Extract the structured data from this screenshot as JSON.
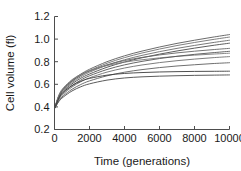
{
  "chart_data": {
    "type": "line",
    "title": "",
    "xlabel": "Time (generations)",
    "ylabel": "Cell volume (fl)",
    "xlim": [
      0,
      10000
    ],
    "ylim": [
      0.2,
      1.2
    ],
    "xticks": [
      0,
      2000,
      4000,
      6000,
      8000,
      10000
    ],
    "yticks": [
      0.2,
      0.4,
      0.6,
      0.8,
      1.0,
      1.2
    ],
    "xtick_labels": [
      "0",
      "2000",
      "4000",
      "6000",
      "8000",
      "10000"
    ],
    "ytick_labels": [
      "0.2",
      "0.4",
      "0.6",
      "0.8",
      "1.0",
      "1.2"
    ],
    "grid": false,
    "legend": false,
    "legend_position": "none",
    "x": [
      0,
      250,
      500,
      1000,
      1500,
      2000,
      3000,
      4000,
      5000,
      6000,
      7000,
      8000,
      9000,
      10000
    ],
    "series": [
      {
        "name": "line-1",
        "color": "#5a5a5a",
        "values": [
          0.385,
          0.5,
          0.56,
          0.635,
          0.69,
          0.733,
          0.8,
          0.852,
          0.894,
          0.93,
          0.962,
          0.99,
          1.016,
          1.04
        ]
      },
      {
        "name": "line-2",
        "color": "#707070",
        "values": [
          0.385,
          0.495,
          0.553,
          0.626,
          0.679,
          0.721,
          0.786,
          0.836,
          0.877,
          0.912,
          0.943,
          0.97,
          0.995,
          1.018
        ]
      },
      {
        "name": "line-3",
        "color": "#6a6a6a",
        "values": [
          0.385,
          0.49,
          0.546,
          0.616,
          0.667,
          0.707,
          0.769,
          0.817,
          0.856,
          0.889,
          0.918,
          0.944,
          0.968,
          0.99
        ]
      },
      {
        "name": "line-4",
        "color": "#4a4a4a",
        "values": [
          0.385,
          0.484,
          0.537,
          0.604,
          0.653,
          0.691,
          0.751,
          0.797,
          0.835,
          0.867,
          0.895,
          0.92,
          0.943,
          0.964
        ]
      },
      {
        "name": "line-5",
        "color": "#646464",
        "values": [
          0.385,
          0.496,
          0.556,
          0.629,
          0.679,
          0.717,
          0.772,
          0.81,
          0.838,
          0.86,
          0.878,
          0.893,
          0.906,
          0.918
        ]
      },
      {
        "name": "line-6",
        "color": "#7a7a7a",
        "values": [
          0.385,
          0.505,
          0.568,
          0.641,
          0.688,
          0.721,
          0.766,
          0.796,
          0.817,
          0.834,
          0.847,
          0.858,
          0.867,
          0.875
        ]
      },
      {
        "name": "line-7",
        "color": "#555555",
        "values": [
          0.385,
          0.472,
          0.522,
          0.588,
          0.637,
          0.675,
          0.731,
          0.772,
          0.803,
          0.828,
          0.848,
          0.865,
          0.879,
          0.892
        ]
      },
      {
        "name": "line-8",
        "color": "#6e6e6e",
        "values": [
          0.385,
          0.466,
          0.513,
          0.576,
          0.622,
          0.657,
          0.708,
          0.744,
          0.771,
          0.792,
          0.809,
          0.823,
          0.835,
          0.845
        ]
      },
      {
        "name": "line-9",
        "color": "#5f5f5f",
        "values": [
          0.385,
          0.455,
          0.498,
          0.556,
          0.598,
          0.63,
          0.675,
          0.707,
          0.73,
          0.748,
          0.762,
          0.773,
          0.783,
          0.791
        ]
      },
      {
        "name": "line-10",
        "color": "#3c3c3c",
        "values": [
          0.385,
          0.478,
          0.529,
          0.589,
          0.627,
          0.652,
          0.681,
          0.696,
          0.704,
          0.709,
          0.712,
          0.714,
          0.715,
          0.716
        ]
      },
      {
        "name": "line-11",
        "color": "#484848",
        "values": [
          0.385,
          0.448,
          0.487,
          0.541,
          0.578,
          0.604,
          0.637,
          0.656,
          0.666,
          0.672,
          0.676,
          0.679,
          0.681,
          0.683
        ]
      }
    ]
  }
}
